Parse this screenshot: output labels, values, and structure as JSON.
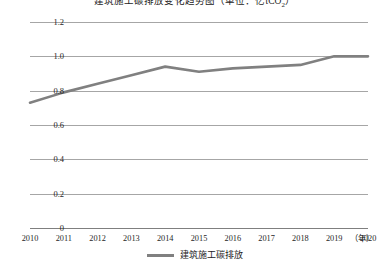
{
  "chart_data": {
    "type": "line",
    "title_main": "建筑施工碳排放变化趋势图（单位：亿tCO",
    "title_sub": "2",
    "title_tail": "）",
    "xlabel": "",
    "ylabel": "",
    "x_unit_label": "（年）",
    "categories": [
      "2010",
      "2011",
      "2012",
      "2013",
      "2014",
      "2015",
      "2016",
      "2017",
      "2018",
      "2019",
      "2020"
    ],
    "x": [
      2010,
      2011,
      2012,
      2013,
      2014,
      2015,
      2016,
      2017,
      2018,
      2019,
      2020
    ],
    "values": [
      0.73,
      0.79,
      0.84,
      0.89,
      0.94,
      0.91,
      0.93,
      0.94,
      0.95,
      1.0,
      1.0
    ],
    "series": [
      {
        "name": "建筑施工碳排放",
        "color": "#808080",
        "values": [
          0.73,
          0.79,
          0.84,
          0.89,
          0.94,
          0.91,
          0.93,
          0.94,
          0.95,
          1.0,
          1.0
        ]
      }
    ],
    "ylim": [
      0,
      1.2
    ],
    "xlim": [
      2010,
      2020
    ],
    "yticks": [
      0,
      0.2,
      0.4,
      0.6,
      0.8,
      1.0,
      1.2
    ],
    "ytick_labels": [
      "0",
      "0.2",
      "0.4",
      "0.6",
      "0.8",
      "1.0",
      "1.2"
    ],
    "grid": true,
    "grid_color": "#a6a6a6",
    "legend": {
      "position": "bottom",
      "entries": [
        {
          "label": "建筑施工碳排放",
          "color": "#808080",
          "marker": "line"
        }
      ]
    },
    "line_width": 2.6,
    "markers": false,
    "background": "#ffffff"
  }
}
